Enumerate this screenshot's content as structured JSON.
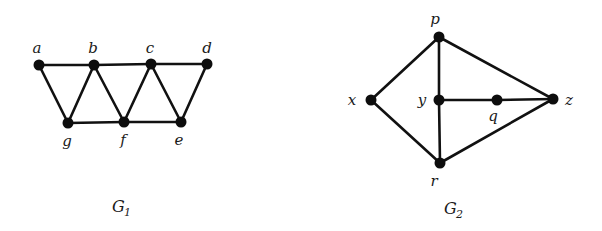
{
  "graphs": [
    {
      "id": "G1",
      "caption": "G",
      "caption_sub": "1",
      "caption_pos": [
        112,
        212
      ],
      "nodes": [
        {
          "id": "a",
          "label": "a",
          "x": 39,
          "y": 65,
          "lx": 37,
          "ly": 53
        },
        {
          "id": "b",
          "label": "b",
          "x": 94,
          "y": 65,
          "lx": 93,
          "ly": 53
        },
        {
          "id": "c",
          "label": "c",
          "x": 151,
          "y": 64,
          "lx": 150,
          "ly": 53
        },
        {
          "id": "d",
          "label": "d",
          "x": 207,
          "y": 64,
          "lx": 207,
          "ly": 53
        },
        {
          "id": "g",
          "label": "g",
          "x": 68,
          "y": 123,
          "lx": 67,
          "ly": 146
        },
        {
          "id": "f",
          "label": "f",
          "x": 124,
          "y": 122,
          "lx": 123,
          "ly": 145
        },
        {
          "id": "e",
          "label": "e",
          "x": 181,
          "y": 122,
          "lx": 179,
          "ly": 145
        }
      ],
      "edges": [
        [
          "a",
          "b"
        ],
        [
          "b",
          "c"
        ],
        [
          "c",
          "d"
        ],
        [
          "a",
          "g"
        ],
        [
          "g",
          "b"
        ],
        [
          "b",
          "f"
        ],
        [
          "f",
          "c"
        ],
        [
          "c",
          "e"
        ],
        [
          "e",
          "d"
        ],
        [
          "g",
          "f"
        ],
        [
          "f",
          "e"
        ]
      ]
    },
    {
      "id": "G2",
      "caption": "G",
      "caption_sub": "2",
      "caption_pos": [
        444,
        214
      ],
      "nodes": [
        {
          "id": "p",
          "label": "p",
          "x": 439,
          "y": 37,
          "lx": 435,
          "ly": 24
        },
        {
          "id": "x",
          "label": "x",
          "x": 371,
          "y": 100,
          "lx": 352,
          "ly": 105
        },
        {
          "id": "y",
          "label": "y",
          "x": 439,
          "y": 100,
          "lx": 422,
          "ly": 105
        },
        {
          "id": "q",
          "label": "q",
          "x": 497,
          "y": 100,
          "lx": 493,
          "ly": 121
        },
        {
          "id": "z",
          "label": "z",
          "x": 553,
          "y": 99,
          "lx": 569,
          "ly": 105
        },
        {
          "id": "r",
          "label": "r",
          "x": 440,
          "y": 163,
          "lx": 434,
          "ly": 186
        }
      ],
      "edges": [
        [
          "p",
          "x"
        ],
        [
          "p",
          "y"
        ],
        [
          "p",
          "z"
        ],
        [
          "x",
          "r"
        ],
        [
          "y",
          "r"
        ],
        [
          "y",
          "q"
        ],
        [
          "q",
          "z"
        ],
        [
          "r",
          "z"
        ]
      ]
    }
  ]
}
